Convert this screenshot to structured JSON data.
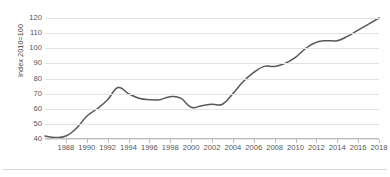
{
  "chart_data": {
    "type": "line",
    "title": "",
    "subtitle": "",
    "xlabel": "",
    "ylabel": "Index 2010=100",
    "ylim": [
      40,
      120
    ],
    "xlim": [
      1986,
      2018
    ],
    "grid": true,
    "legend": false,
    "legend_position": "none",
    "line_color": "#585858",
    "grid_color": "#e2e2e2",
    "yticks": [
      120,
      110,
      100,
      90,
      80,
      70,
      60,
      50,
      40
    ],
    "xticks": [
      1988,
      1990,
      1992,
      1994,
      1996,
      1998,
      2000,
      2002,
      2004,
      2006,
      2008,
      2010,
      2012,
      2014,
      2016,
      2018
    ],
    "x": [
      1986,
      1987,
      1988,
      1989,
      1990,
      1991,
      1992,
      1993,
      1994,
      1995,
      1996,
      1997,
      1998,
      1999,
      2000,
      2001,
      2002,
      2003,
      2004,
      2005,
      2006,
      2007,
      2008,
      2009,
      2010,
      2011,
      2012,
      2013,
      2014,
      2015,
      2016,
      2017,
      2018
    ],
    "series": [
      {
        "name": "Index",
        "values": [
          42,
          41,
          42,
          47,
          55,
          60,
          66,
          74,
          70,
          67,
          66,
          66,
          68,
          67,
          61,
          62,
          63,
          63,
          70,
          78,
          84,
          88,
          88,
          90,
          94,
          100,
          104,
          105,
          105,
          108,
          112,
          116,
          120
        ]
      }
    ]
  }
}
